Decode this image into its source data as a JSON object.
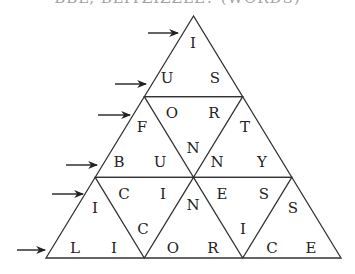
{
  "header": {
    "title_partial": "BBL, BLITZIZZLE? (WORDS)"
  },
  "puzzle": {
    "line_color": "#333333",
    "arrow_color": "#222222",
    "outer_triangle": {
      "apex": [
        193.5,
        16
      ],
      "base_left": [
        46,
        258
      ],
      "base_right": [
        341,
        258
      ]
    },
    "rows": [
      {
        "label": "row-1",
        "letters": [
          "I"
        ]
      },
      {
        "label": "row-2",
        "letters": [
          "U",
          "S"
        ]
      },
      {
        "label": "row-3",
        "letters": [
          "F",
          "O",
          "R",
          "T"
        ]
      },
      {
        "label": "row-4",
        "letters": [
          "B",
          "U",
          "N",
          "N",
          "Y"
        ]
      },
      {
        "label": "row-5",
        "letters": [
          "I",
          "C",
          "I",
          "N",
          "E",
          "S",
          "S"
        ]
      },
      {
        "label": "row-6",
        "letters": [
          "L",
          "I",
          "C",
          "O",
          "R",
          "I",
          "C",
          "E"
        ]
      }
    ],
    "letters": [
      {
        "ch": "I",
        "x": 193,
        "y": 43
      },
      {
        "ch": "U",
        "x": 167,
        "y": 78
      },
      {
        "ch": "S",
        "x": 215,
        "y": 78
      },
      {
        "ch": "O",
        "x": 172,
        "y": 113
      },
      {
        "ch": "R",
        "x": 214,
        "y": 113
      },
      {
        "ch": "F",
        "x": 142,
        "y": 127
      },
      {
        "ch": "T",
        "x": 245,
        "y": 127
      },
      {
        "ch": "N",
        "x": 193,
        "y": 148
      },
      {
        "ch": "B",
        "x": 119,
        "y": 162
      },
      {
        "ch": "U",
        "x": 160,
        "y": 162
      },
      {
        "ch": "N",
        "x": 217,
        "y": 162
      },
      {
        "ch": "Y",
        "x": 262,
        "y": 162
      },
      {
        "ch": "C",
        "x": 124,
        "y": 194
      },
      {
        "ch": "I",
        "x": 163,
        "y": 194
      },
      {
        "ch": "E",
        "x": 222,
        "y": 194
      },
      {
        "ch": "S",
        "x": 264,
        "y": 194
      },
      {
        "ch": "I",
        "x": 95,
        "y": 208
      },
      {
        "ch": "N",
        "x": 193,
        "y": 205
      },
      {
        "ch": "S",
        "x": 293,
        "y": 208
      },
      {
        "ch": "C",
        "x": 143,
        "y": 229
      },
      {
        "ch": "I",
        "x": 243,
        "y": 229
      },
      {
        "ch": "L",
        "x": 75,
        "y": 248
      },
      {
        "ch": "I",
        "x": 114,
        "y": 248
      },
      {
        "ch": "O",
        "x": 173,
        "y": 248
      },
      {
        "ch": "R",
        "x": 213,
        "y": 248
      },
      {
        "ch": "C",
        "x": 272,
        "y": 248
      },
      {
        "ch": "E",
        "x": 311,
        "y": 248
      }
    ],
    "arrows": [
      {
        "x1": 148,
        "x2": 178,
        "y": 33
      },
      {
        "x1": 115,
        "x2": 146,
        "y": 84
      },
      {
        "x1": 98,
        "x2": 130,
        "y": 115
      },
      {
        "x1": 66,
        "x2": 97,
        "y": 165
      },
      {
        "x1": 52,
        "x2": 83,
        "y": 194
      },
      {
        "x1": 17,
        "x2": 45,
        "y": 250
      }
    ]
  }
}
